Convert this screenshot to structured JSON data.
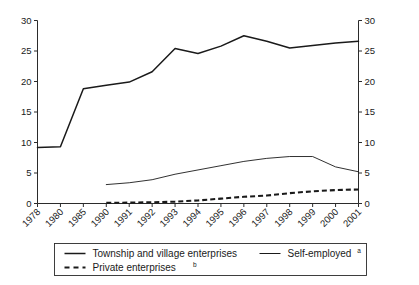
{
  "chart_data": {
    "type": "line",
    "title": "",
    "subtitle": "",
    "xlabel": "",
    "ylabel": "",
    "ylim": [
      0,
      30
    ],
    "y_ticks": [
      0,
      5,
      10,
      15,
      20,
      25,
      30
    ],
    "y_tick_labels": [
      "0",
      "5",
      "10",
      "15",
      "20",
      "25",
      "30"
    ],
    "right_axis": true,
    "right_ylim": [
      0,
      30
    ],
    "right_y_ticks": [
      0,
      5,
      10,
      15,
      20,
      25,
      30
    ],
    "right_y_tick_labels": [
      "0",
      "5",
      "10",
      "15",
      "20",
      "25",
      "30"
    ],
    "grid": false,
    "legend_position": "bottom",
    "categories": [
      "1978",
      "1980",
      "1985",
      "1990",
      "1991",
      "1992",
      "1993",
      "1994",
      "1995",
      "1996",
      "1997",
      "1998",
      "1999",
      "2000",
      "2001"
    ],
    "x_tick_labels": [
      "1978",
      "1980",
      "1985",
      "1990",
      "1991",
      "1992",
      "1993",
      "1994",
      "1995",
      "1996",
      "1997",
      "1998",
      "1999",
      "2000",
      "2001"
    ],
    "series": [
      {
        "name": "Township and village enterprises",
        "style": "solid-thick",
        "values": [
          9.2,
          9.3,
          18.8,
          19.4,
          19.9,
          21.6,
          25.4,
          24.6,
          25.8,
          27.5,
          26.6,
          25.5,
          25.9,
          26.3,
          26.6
        ]
      },
      {
        "name": "Self-employed",
        "style": "solid-thin",
        "values": [
          null,
          null,
          null,
          3.1,
          3.4,
          3.9,
          4.8,
          5.5,
          6.2,
          6.9,
          7.4,
          7.7,
          7.7,
          6.0,
          5.2
        ]
      },
      {
        "name": "Private enterprises",
        "style": "dashed",
        "values": [
          null,
          null,
          null,
          0.1,
          0.15,
          0.2,
          0.3,
          0.5,
          0.8,
          1.1,
          1.3,
          1.7,
          2.0,
          2.2,
          2.3
        ]
      }
    ]
  },
  "legend": {
    "entries": [
      {
        "label": "Township and village enterprises",
        "superscript": "",
        "style": "solid-thick"
      },
      {
        "label": "Self-employed",
        "superscript": "a",
        "style": "solid-thin"
      },
      {
        "label": "Private enterprises",
        "superscript": "b",
        "style": "dashed"
      }
    ]
  },
  "colors": {
    "line": "#1a1a1a",
    "axis": "#2b2b2b",
    "background": "#ffffff"
  }
}
